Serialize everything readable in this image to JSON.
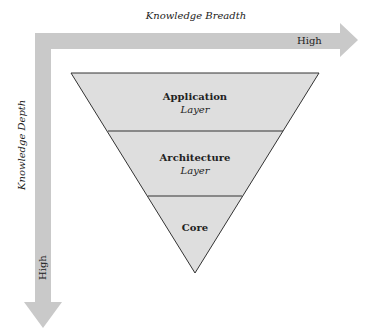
{
  "axes": {
    "x_title": "Knowledge Breadth",
    "x_high": "High",
    "y_title": "Knowledge Depth",
    "y_high": "High"
  },
  "layers": [
    {
      "name": "Application",
      "sub": "Layer"
    },
    {
      "name": "Architecture",
      "sub": "Layer"
    },
    {
      "name": "Core",
      "sub": ""
    }
  ],
  "colors": {
    "arrow": "#c8c8c8",
    "triangle_fill": "#dcdcdc",
    "stroke": "#333333"
  }
}
